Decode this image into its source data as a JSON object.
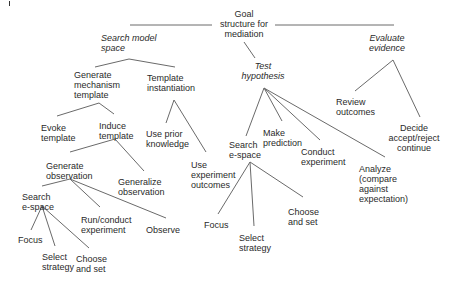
{
  "diagram": {
    "root": "Goal\nstructure for\nmediation",
    "subgoals": {
      "search_model_space": "Search model\nspace",
      "test_hypothesis": "Test\nhypothesis",
      "evaluate_evidence": "Evaluate\nevidence"
    },
    "search_model_space_children": {
      "generate_mechanism_template": "Generate\nmechanism\ntemplate",
      "template_instantiation": "Template\ninstantiation"
    },
    "generate_mechanism_template_children": {
      "evoke_template": "Evoke\ntemplate",
      "induce_template": "Induce\ntemplate"
    },
    "template_instantiation_children": {
      "use_prior_knowledge": "Use prior\nknowledge",
      "use_experiment_outcomes": "Use\nexperiment\noutcomes"
    },
    "induce_template_children": {
      "generate_observation": "Generate\nobservation",
      "generalize_observation": "Generalize\nobservation"
    },
    "generate_observation_children": {
      "search_e_space": "Search\ne-space",
      "run_conduct_experiment": "Run/conduct\nexperiment",
      "observe": "Observe"
    },
    "left_search_e_space_children": {
      "focus": "Focus",
      "select_strategy": "Select\nstrategy",
      "choose_and_set": "Choose\nand set"
    },
    "test_hypothesis_children": {
      "search_e_space": "Search\ne-space",
      "make_prediction": "Make\nprediction",
      "conduct_experiment": "Conduct\nexperiment",
      "analyze": "Analyze\n(compare\nagainst\nexpectation)"
    },
    "right_search_e_space_children": {
      "focus": "Focus",
      "select_strategy": "Select\nstrategy",
      "choose_and_set": "Choose\nand set"
    },
    "evaluate_evidence_children": {
      "review_outcomes": "Review\noutcomes",
      "decide": "Decide\naccept/reject\ncontinue"
    }
  }
}
